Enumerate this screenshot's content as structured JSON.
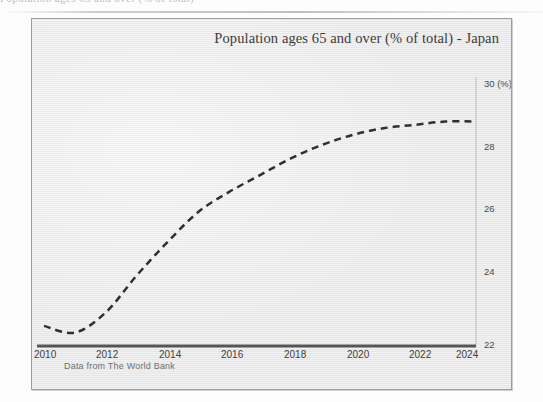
{
  "page": {
    "cut_off_text_above": "Population ages 65 and over (% of total)"
  },
  "chart": {
    "title": "Population ages 65 and over (% of total) - Japan",
    "source_note": "Data from The World Bank",
    "y_axis_unit_label": "30 (%)",
    "colors": {
      "frame_background": "#ececec",
      "frame_border": "#9c9c9c",
      "axis_line": "#555555",
      "series_line": "#2f2f2f",
      "tick_label": "#4a4a4a",
      "title_text": "#3b3b3b",
      "source_text": "#6f6f6f"
    }
  },
  "chart_data": {
    "type": "line",
    "title": "Population ages 65 and over (% of total) - Japan",
    "xlabel": "",
    "ylabel": "(%)",
    "xlim": [
      2010,
      2024
    ],
    "ylim": [
      22,
      30
    ],
    "grid": false,
    "legend": null,
    "y_axis_position": "right",
    "line_style": "dashed",
    "x_ticks": [
      2010,
      2012,
      2014,
      2016,
      2018,
      2020,
      2022,
      2024
    ],
    "x_tick_labels": [
      "2010",
      "2012",
      "2014",
      "2016",
      "2018",
      "2020",
      "2022",
      "2024"
    ],
    "y_ticks": [
      22,
      24,
      26,
      28,
      30
    ],
    "y_tick_labels": [
      "22",
      "24",
      "26",
      "28",
      "30 (%)"
    ],
    "x": [
      2010,
      2011,
      2012,
      2013,
      2014,
      2015,
      2016,
      2017,
      2018,
      2019,
      2020,
      2021,
      2022,
      2023,
      2024
    ],
    "values": [
      22.6,
      22.4,
      23.0,
      24.1,
      25.1,
      26.0,
      26.6,
      27.1,
      27.6,
      28.0,
      28.3,
      28.5,
      28.6,
      28.7,
      28.7
    ],
    "series": [
      {
        "name": "Population ages 65 and over (% of total) - Japan",
        "values": [
          22.6,
          22.4,
          23.0,
          24.1,
          25.1,
          26.0,
          26.6,
          27.1,
          27.6,
          28.0,
          28.3,
          28.5,
          28.6,
          28.7,
          28.7
        ]
      }
    ]
  }
}
